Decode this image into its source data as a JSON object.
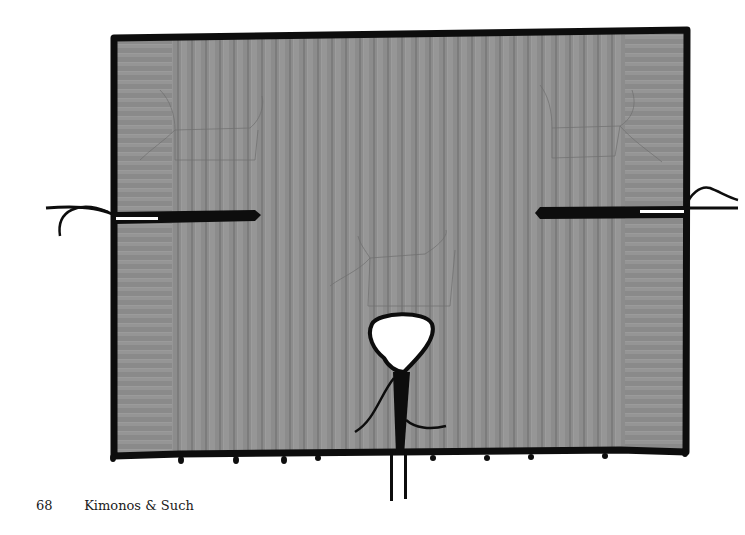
{
  "page": {
    "number": "68",
    "running_title": "Kimonos & Such"
  },
  "figure": {
    "colors": {
      "fabric": "#8a8a8a",
      "fabric_stripe_dark": "#7a7a7a",
      "fabric_stripe_light": "#9a9a9a",
      "binding": "#0d0d0d",
      "background": "#ffffff"
    }
  }
}
